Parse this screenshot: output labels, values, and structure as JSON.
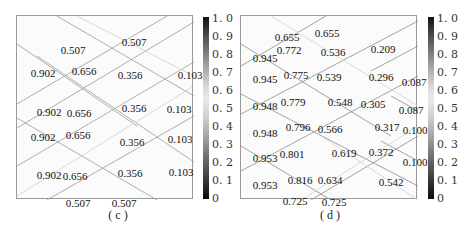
{
  "chart_data": [
    {
      "type": "heatmap",
      "panel": "c",
      "caption": "( c )",
      "colorbar": {
        "ticks": [
          "1. 0",
          "0. 9",
          "0. 8",
          "0. 7",
          "0. 6",
          "0. 5",
          "0. 4",
          "0. 3",
          "0. 2",
          "0. 1",
          "0"
        ],
        "range": [
          0,
          1.0
        ],
        "colormap": "grayscale dark-light-dark"
      },
      "labels": [
        {
          "text": "0.507",
          "x": 44,
          "y": 20
        },
        {
          "text": "0.507",
          "x": 105,
          "y": 12
        },
        {
          "text": "0.902",
          "x": 14,
          "y": 43
        },
        {
          "text": "0.656",
          "x": 55,
          "y": 41
        },
        {
          "text": "0.356",
          "x": 101,
          "y": 45
        },
        {
          "text": "0.103",
          "x": 161,
          "y": 45
        },
        {
          "text": "0.902",
          "x": 20,
          "y": 82
        },
        {
          "text": "0.656",
          "x": 50,
          "y": 83
        },
        {
          "text": "0.356",
          "x": 105,
          "y": 78
        },
        {
          "text": "0.103",
          "x": 150,
          "y": 79
        },
        {
          "text": "0.902",
          "x": 14,
          "y": 107
        },
        {
          "text": "0.656",
          "x": 49,
          "y": 105
        },
        {
          "text": "0.356",
          "x": 103,
          "y": 112
        },
        {
          "text": "0.103",
          "x": 151,
          "y": 109
        },
        {
          "text": "0.902",
          "x": 20,
          "y": 145
        },
        {
          "text": "0.656",
          "x": 46,
          "y": 146
        },
        {
          "text": "0.356",
          "x": 101,
          "y": 143
        },
        {
          "text": "0.103",
          "x": 152,
          "y": 142
        },
        {
          "text": "0.507",
          "x": 49,
          "y": 173
        },
        {
          "text": "0.507",
          "x": 95,
          "y": 173
        }
      ]
    },
    {
      "type": "heatmap",
      "panel": "d",
      "caption": "( d )",
      "colorbar": {
        "ticks": [
          "1. 0",
          "0. 9",
          "0. 8",
          "0. 7",
          "0. 6",
          "0. 5",
          "0. 4",
          "0. 3",
          "0. 2",
          "0. 1",
          "0"
        ],
        "range": [
          0,
          1.0
        ],
        "colormap": "grayscale dark-light-dark"
      },
      "labels": [
        {
          "text": "0.655",
          "x": 34,
          "y": 7
        },
        {
          "text": "0.655",
          "x": 74,
          "y": 3
        },
        {
          "text": "0.945",
          "x": 12,
          "y": 28
        },
        {
          "text": "0.772",
          "x": 36,
          "y": 20
        },
        {
          "text": "0.536",
          "x": 80,
          "y": 22
        },
        {
          "text": "0.209",
          "x": 130,
          "y": 19
        },
        {
          "text": "0.945",
          "x": 12,
          "y": 49
        },
        {
          "text": "0.775",
          "x": 43,
          "y": 45
        },
        {
          "text": "0.539",
          "x": 76,
          "y": 47
        },
        {
          "text": "0.296",
          "x": 128,
          "y": 47
        },
        {
          "text": "0.087",
          "x": 161,
          "y": 52
        },
        {
          "text": "0.948",
          "x": 12,
          "y": 76
        },
        {
          "text": "0.779",
          "x": 40,
          "y": 72
        },
        {
          "text": "0.548",
          "x": 87,
          "y": 72
        },
        {
          "text": "0.305",
          "x": 120,
          "y": 74
        },
        {
          "text": "0.087",
          "x": 158,
          "y": 80
        },
        {
          "text": "0.948",
          "x": 12,
          "y": 103
        },
        {
          "text": "0.796",
          "x": 45,
          "y": 97
        },
        {
          "text": "0.566",
          "x": 77,
          "y": 99
        },
        {
          "text": "0.317",
          "x": 134,
          "y": 97
        },
        {
          "text": "0.100",
          "x": 162,
          "y": 100
        },
        {
          "text": "0.953",
          "x": 12,
          "y": 128
        },
        {
          "text": "0.801",
          "x": 39,
          "y": 124
        },
        {
          "text": "0.619",
          "x": 91,
          "y": 123
        },
        {
          "text": "0.372",
          "x": 128,
          "y": 122
        },
        {
          "text": "0.100",
          "x": 162,
          "y": 132
        },
        {
          "text": "0.953",
          "x": 12,
          "y": 155
        },
        {
          "text": "0.816",
          "x": 47,
          "y": 150
        },
        {
          "text": "0.634",
          "x": 77,
          "y": 150
        },
        {
          "text": "0.542",
          "x": 138,
          "y": 152
        },
        {
          "text": "0.725",
          "x": 42,
          "y": 171
        },
        {
          "text": "0.725",
          "x": 81,
          "y": 172
        }
      ]
    }
  ]
}
